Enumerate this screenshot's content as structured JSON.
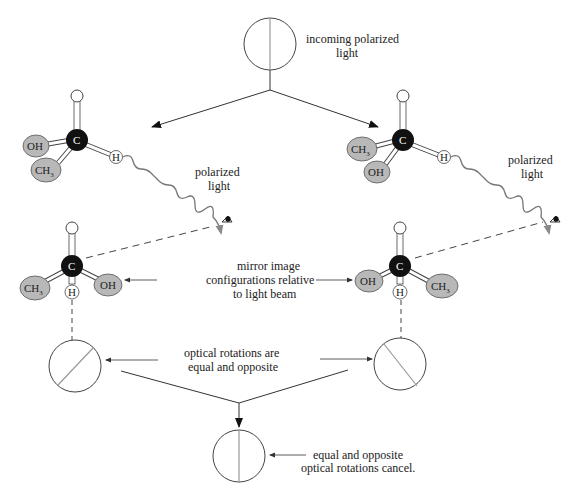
{
  "labels": {
    "incoming_1": "incoming polarized",
    "incoming_2": "light",
    "polarized_left_1": "polarized",
    "polarized_left_2": "light",
    "polarized_right_1": "polarized",
    "polarized_right_2": "light",
    "mirror_1": "mirror image",
    "mirror_2": "configurations relative",
    "mirror_3": "to light beam",
    "rotations_1": "optical rotations are",
    "rotations_2": "equal and opposite",
    "cancel_1": "equal and opposite",
    "cancel_2": "optical rotations cancel."
  },
  "atoms": {
    "carbon": "C",
    "hydrogen": "H",
    "hydroxyl": "OH",
    "methyl": "CH",
    "methyl_sub": "3"
  },
  "colors": {
    "carbon": "#111111",
    "group_fill": "#b8b8b8",
    "wave": "#777777",
    "line": "#333333",
    "polarizer_line": "#999999"
  }
}
